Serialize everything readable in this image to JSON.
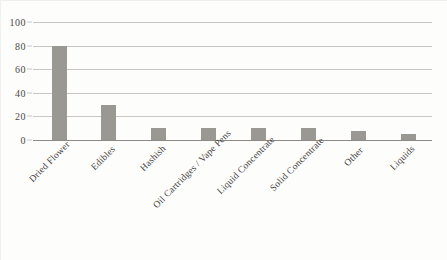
{
  "chart_data": {
    "type": "bar",
    "title": "",
    "subtitle": "",
    "xlabel": "",
    "ylabel": "",
    "ylim": [
      0,
      100
    ],
    "yticks": [
      0,
      20,
      40,
      60,
      80,
      100
    ],
    "ytick_labels": [
      "0",
      "20",
      "40",
      "60",
      "80",
      "100"
    ],
    "grid": true,
    "legend": false,
    "legend_position": "none",
    "bar_color": "#9a9892",
    "gridline_color": "#c9c7c4",
    "axis_color": "#8d8a86",
    "background_color": "#fdfdfc",
    "categories": [
      "Dried Flower",
      "Edibles",
      "Hashish",
      "Oil Cartridges / Vape Pens",
      "Liquid Concentrate",
      "Solid Concentrate",
      "Other",
      "Liquids"
    ],
    "values": [
      80,
      30,
      10,
      10,
      10,
      10,
      8,
      5
    ]
  }
}
